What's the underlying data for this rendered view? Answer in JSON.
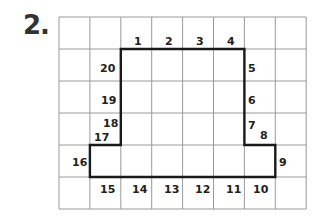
{
  "problem": {
    "label": "2."
  },
  "grid": {
    "columns": 8,
    "rows": 6,
    "left": 59,
    "top": 17,
    "cell_w": 30.9,
    "cell_h": 32,
    "line_color": "#9a9a9a",
    "outline_color": "#1a1a1a"
  },
  "outline_vertices": [
    [
      2,
      1
    ],
    [
      6,
      1
    ],
    [
      6,
      4
    ],
    [
      7,
      4
    ],
    [
      7,
      5
    ],
    [
      1,
      5
    ],
    [
      1,
      4
    ],
    [
      2,
      4
    ]
  ],
  "numbers": [
    {
      "text": "1",
      "x": 134,
      "y": 45
    },
    {
      "text": "2",
      "x": 165,
      "y": 45
    },
    {
      "text": "3",
      "x": 196,
      "y": 45
    },
    {
      "text": "4",
      "x": 227,
      "y": 45
    },
    {
      "text": "5",
      "x": 248,
      "y": 72
    },
    {
      "text": "6",
      "x": 248,
      "y": 104
    },
    {
      "text": "7",
      "x": 248,
      "y": 129
    },
    {
      "text": "8",
      "x": 260,
      "y": 139
    },
    {
      "text": "9",
      "x": 279,
      "y": 166
    },
    {
      "text": "10",
      "x": 253,
      "y": 193
    },
    {
      "text": "11",
      "x": 226,
      "y": 193
    },
    {
      "text": "12",
      "x": 195,
      "y": 193
    },
    {
      "text": "13",
      "x": 164,
      "y": 193
    },
    {
      "text": "14",
      "x": 132,
      "y": 193
    },
    {
      "text": "15",
      "x": 100,
      "y": 193
    },
    {
      "text": "16",
      "x": 72,
      "y": 166
    },
    {
      "text": "17",
      "x": 94,
      "y": 141
    },
    {
      "text": "18",
      "x": 103,
      "y": 127
    },
    {
      "text": "19",
      "x": 101,
      "y": 104
    },
    {
      "text": "20",
      "x": 100,
      "y": 72
    }
  ]
}
